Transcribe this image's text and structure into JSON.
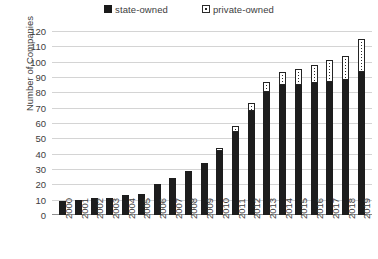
{
  "chart_data": {
    "type": "bar",
    "subtype": "stacked-column",
    "title": "",
    "xlabel": "",
    "ylabel": "Number of Companies",
    "ylim": [
      0,
      120
    ],
    "ytick_step": 10,
    "yticks": [
      120,
      110,
      100,
      90,
      80,
      70,
      60,
      50,
      40,
      30,
      20,
      10,
      0
    ],
    "grid": true,
    "legend_position": "top-center",
    "categories": [
      "2000",
      "2001",
      "2002",
      "2003",
      "2004",
      "2005",
      "2006",
      "2007",
      "2008",
      "2009",
      "2010",
      "2011",
      "2012",
      "2013",
      "2014",
      "2015",
      "2016",
      "2017",
      "2018",
      "2019"
    ],
    "series": [
      {
        "name": "state-owned",
        "color": "#1d1d1d",
        "marker": "filled-square",
        "values": [
          9,
          10,
          11,
          11,
          13,
          14,
          20,
          24,
          29,
          34,
          42,
          54,
          68,
          80,
          85,
          85,
          86,
          87,
          88,
          93
        ]
      },
      {
        "name": "private-owned",
        "color": "#ffffff",
        "marker": "open-square",
        "values": [
          0,
          0,
          0,
          0,
          0,
          0,
          0,
          0,
          0,
          0,
          2,
          4,
          5,
          7,
          8,
          10,
          12,
          14,
          16,
          22
        ]
      }
    ],
    "totals": [
      9,
      10,
      11,
      11,
      13,
      14,
      20,
      24,
      29,
      34,
      44,
      58,
      73,
      87,
      93,
      95,
      98,
      101,
      104,
      115
    ]
  },
  "legend": {
    "items": [
      {
        "label": "state-owned",
        "swatch": "filled-square-icon"
      },
      {
        "label": "private-owned",
        "swatch": "open-square-icon"
      }
    ]
  },
  "axes": {
    "y_title": "Number of Companies"
  }
}
